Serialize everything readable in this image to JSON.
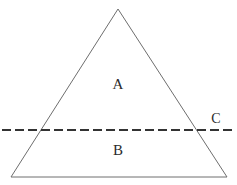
{
  "figure": {
    "width": 237,
    "height": 185,
    "background_color": "#ffffff"
  },
  "labels": {
    "upper_region": "A",
    "lower_region": "B",
    "dashed_line": "C"
  },
  "colors": {
    "triangle_stroke": "#6e6e6e",
    "dashed_stroke": "#333333",
    "label_text": "#2b2b2b",
    "background": "#ffffff"
  },
  "geometry": {
    "triangle": {
      "apex": [
        118,
        9
      ],
      "bottom_left": [
        11,
        177
      ],
      "bottom_right": [
        227,
        177
      ],
      "stroke_width": 1
    },
    "dashed_line": {
      "x1": 2,
      "y1": 130,
      "x2": 233,
      "y2": 130,
      "stroke_width": 2,
      "dash_length": 9,
      "gap_length": 4,
      "intersection_left": [
        40,
        130
      ],
      "intersection_right": [
        197,
        130
      ]
    },
    "label_positions": {
      "upper_region": [
        118,
        85
      ],
      "lower_region": [
        118,
        151
      ],
      "dashed_line": [
        216,
        119
      ]
    }
  }
}
